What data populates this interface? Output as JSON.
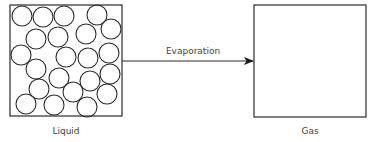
{
  "diagram": {
    "type": "state-change",
    "colors": {
      "stroke": "#2b2b2b",
      "text": "#444444",
      "background": "#ffffff"
    },
    "nodes": [
      {
        "id": "liquid",
        "label": "Liquid",
        "box": {
          "x": 10,
          "y": 5,
          "w": 112,
          "h": 111
        },
        "particles": {
          "radius": 10,
          "centers": [
            [
              22,
              16
            ],
            [
              43,
              17
            ],
            [
              64,
              16
            ],
            [
              97,
              15
            ],
            [
              111,
              29
            ],
            [
              86,
              34
            ],
            [
              58,
              37
            ],
            [
              36,
              39
            ],
            [
              21,
              55
            ],
            [
              66,
              57
            ],
            [
              88,
              58
            ],
            [
              109,
              53
            ],
            [
              36,
              69
            ],
            [
              59,
              78
            ],
            [
              90,
              81
            ],
            [
              110,
              74
            ],
            [
              39,
              89
            ],
            [
              73,
              92
            ],
            [
              107,
              94
            ],
            [
              26,
              104
            ],
            [
              54,
              105
            ],
            [
              87,
              107
            ]
          ]
        }
      },
      {
        "id": "gas",
        "label": "Gas",
        "box": {
          "x": 254,
          "y": 5,
          "w": 112,
          "h": 112
        },
        "particles": {
          "radius": 10,
          "centers": []
        }
      }
    ],
    "edges": [
      {
        "from": "liquid",
        "to": "gas",
        "label": "Evaporation",
        "y": 61
      }
    ]
  }
}
